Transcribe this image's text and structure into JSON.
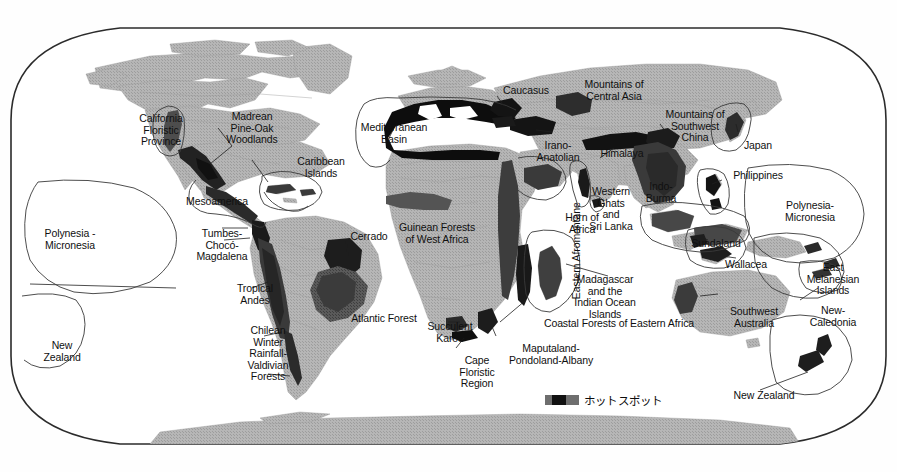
{
  "map": {
    "title": "Global Biodiversity Hotspots",
    "projection": "robinson-rounded",
    "colors": {
      "ocean": "#ffffff",
      "land": "#b3b3b3",
      "land_stipple": "#a8a8a8",
      "hotspot_dark": "#4a4a4a",
      "hotspot_black": "#111111",
      "outline": "#2b2b2b",
      "border_line": "#c9c9c9",
      "text": "#101010"
    },
    "frame": {
      "x": 11,
      "y": 26,
      "width": 875,
      "height": 420
    }
  },
  "legend": {
    "swatch_name": "hotspot-swatch",
    "label": "ホットスポット",
    "x": 545,
    "y": 392
  },
  "labels": [
    {
      "id": "california-floristic-province",
      "text": "California\nFloristic\nProvince",
      "x": 130,
      "y": 113,
      "align": "center",
      "w": 62
    },
    {
      "id": "madrean-pine-oak-woodlands",
      "text": "Madrean\nPine-Oak\nWoodlands",
      "x": 216,
      "y": 111,
      "align": "center",
      "w": 72
    },
    {
      "id": "caribbean-islands",
      "text": "Caribbean\nIslands",
      "x": 290,
      "y": 156,
      "align": "center",
      "w": 62
    },
    {
      "id": "mesoamerica",
      "text": "Mesoamerica",
      "x": 180,
      "y": 196,
      "align": "center",
      "w": 74
    },
    {
      "id": "tumbes-choco-magdalena",
      "text": "Tumbes-\nChocó-\nMagdalena",
      "x": 189,
      "y": 228,
      "align": "center",
      "w": 66
    },
    {
      "id": "cerrado",
      "text": "Cerrado",
      "x": 345,
      "y": 231,
      "align": "center",
      "w": 48
    },
    {
      "id": "tropical-andes",
      "text": "Tropical\nAndes",
      "x": 230,
      "y": 283,
      "align": "center",
      "w": 50
    },
    {
      "id": "atlantic-forest",
      "text": "Atlantic Forest",
      "x": 343,
      "y": 313,
      "align": "center",
      "w": 82
    },
    {
      "id": "chilean-winter-rainfall-valdivian-forests",
      "text": "Chilean\nWinter\nRainfall-\nValdivian\nForests",
      "x": 241,
      "y": 325,
      "align": "center",
      "w": 54
    },
    {
      "id": "polynesia-micronesia-west",
      "text": "Polynesia -\nMicronesia",
      "x": 35,
      "y": 228,
      "align": "center",
      "w": 70
    },
    {
      "id": "new-zealand-west",
      "text": "New\nZealand",
      "x": 35,
      "y": 340,
      "align": "center",
      "w": 54
    },
    {
      "id": "mediterranean-basin",
      "text": "Mediterranean\nBasin",
      "x": 352,
      "y": 122,
      "align": "center",
      "w": 84
    },
    {
      "id": "caucasus",
      "text": "Caucasus",
      "x": 497,
      "y": 85,
      "align": "center",
      "w": 58
    },
    {
      "id": "mountains-of-central-asia",
      "text": "Mountains of\nCentral Asia",
      "x": 577,
      "y": 79,
      "align": "center",
      "w": 74
    },
    {
      "id": "irano-anatolian",
      "text": "Irano-\nAnatolian",
      "x": 531,
      "y": 140,
      "align": "center",
      "w": 54
    },
    {
      "id": "himalaya",
      "text": "Himalaya",
      "x": 595,
      "y": 148,
      "align": "center",
      "w": 54
    },
    {
      "id": "mountains-of-southwest-china",
      "text": "Mountains of\nSouthwest\nChina",
      "x": 658,
      "y": 109,
      "align": "center",
      "w": 74
    },
    {
      "id": "japan",
      "text": "Japan",
      "x": 738,
      "y": 140,
      "align": "center",
      "w": 40
    },
    {
      "id": "philippines",
      "text": "Philippines",
      "x": 726,
      "y": 170,
      "align": "center",
      "w": 64
    },
    {
      "id": "indo-burma",
      "text": "Indo-\nBurma",
      "x": 641,
      "y": 181,
      "align": "center",
      "w": 40
    },
    {
      "id": "western-ghats-and-sri-lanka",
      "text": "Western\nGhats\nand\nSri Lanka",
      "x": 583,
      "y": 186,
      "align": "center",
      "w": 56
    },
    {
      "id": "guinean-forests-of-west-africa",
      "text": "Guinean Forests\nof West Africa",
      "x": 392,
      "y": 222,
      "align": "center",
      "w": 90
    },
    {
      "id": "eastern-afromontane",
      "text": "Eastern   Afromontane",
      "x": 512,
      "y": 245,
      "align": "center",
      "w": 130,
      "rotate": -90
    },
    {
      "id": "horn-of-africa",
      "text": "Horn of\nAfrica",
      "x": 559,
      "y": 212,
      "align": "center",
      "w": 46
    },
    {
      "id": "sundaland",
      "text": "Sundaland",
      "x": 685,
      "y": 238,
      "align": "center",
      "w": 62
    },
    {
      "id": "wallacea",
      "text": "Wallacea",
      "x": 719,
      "y": 259,
      "align": "center",
      "w": 54
    },
    {
      "id": "polynesia-micronesia-east",
      "text": "Polynesia-\nMicronesia",
      "x": 777,
      "y": 200,
      "align": "center",
      "w": 66
    },
    {
      "id": "east-melanesian-islands",
      "text": "East\nMelanesian\nIslands",
      "x": 801,
      "y": 262,
      "align": "center",
      "w": 64
    },
    {
      "id": "new-caledonia",
      "text": "New-\nCaledonia",
      "x": 803,
      "y": 305,
      "align": "center",
      "w": 60
    },
    {
      "id": "southwest-australia",
      "text": "Southwest\nAustralia",
      "x": 723,
      "y": 306,
      "align": "center",
      "w": 62
    },
    {
      "id": "new-zealand-east",
      "text": "New Zealand",
      "x": 726,
      "y": 390,
      "align": "center",
      "w": 76
    },
    {
      "id": "madagascar-and-the-indian-ocean-islands",
      "text": "Madagascar\nand the\nIndian Ocean\nIslands",
      "x": 567,
      "y": 274,
      "align": "center",
      "w": 76
    },
    {
      "id": "coastal-forests-of-eastern-africa",
      "text": "Coastal Forests of Eastern Africa",
      "x": 530,
      "y": 318,
      "align": "center",
      "w": 178
    },
    {
      "id": "succulent-karoo",
      "text": "Succulent\nKaroo",
      "x": 421,
      "y": 321,
      "align": "center",
      "w": 58
    },
    {
      "id": "maputaland-pondoland-albany",
      "text": "Maputaland-\nPondoland-Albany",
      "x": 501,
      "y": 343,
      "align": "center",
      "w": 100
    },
    {
      "id": "cape-floristic-region",
      "text": "Cape\nFloristic\nRegion",
      "x": 454,
      "y": 355,
      "align": "center",
      "w": 46
    }
  ]
}
